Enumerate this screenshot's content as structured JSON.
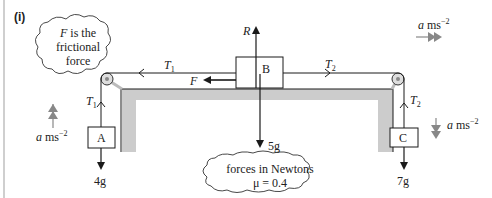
{
  "part_label": "(i)",
  "cloud_friction": {
    "line1_var": "F",
    "line1_rest": " is the",
    "line2": "frictional",
    "line3": "force"
  },
  "cloud_info": {
    "line1": "forces in Newtons",
    "line2": "μ = 0.4"
  },
  "blocks": {
    "A": "A",
    "B": "B",
    "C": "C"
  },
  "forces": {
    "R": "R",
    "F": "F",
    "T1_top": "T",
    "T1_top_sub": "1",
    "T2_top": "T",
    "T2_top_sub": "2",
    "T1_vert": "T",
    "T1_vert_sub": "1",
    "T2_vert": "T",
    "T2_vert_sub": "2",
    "weight_A": "4g",
    "weight_B": "5g",
    "weight_C": "7g"
  },
  "acceleration": {
    "var": "a",
    "unit": " ms",
    "exp": "−2"
  },
  "colors": {
    "line": "#1a1a1a",
    "table": "#cccccc",
    "accel_arrow": "#888888",
    "side_bar": "#cfcfcf"
  }
}
